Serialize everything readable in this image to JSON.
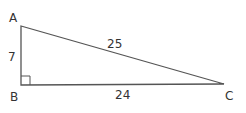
{
  "diagram": {
    "type": "right-triangle",
    "vertices": [
      {
        "label": "A",
        "x": 21,
        "y": 26
      },
      {
        "label": "B",
        "x": 21,
        "y": 85
      },
      {
        "label": "C",
        "x": 224,
        "y": 84
      }
    ],
    "sides": [
      {
        "name": "AB",
        "length_label": "7"
      },
      {
        "name": "AC",
        "length_label": "25"
      },
      {
        "name": "BC",
        "length_label": "24"
      }
    ],
    "right_angle_at": "B",
    "colors": {
      "line": "#555555",
      "text": "#333333"
    }
  }
}
